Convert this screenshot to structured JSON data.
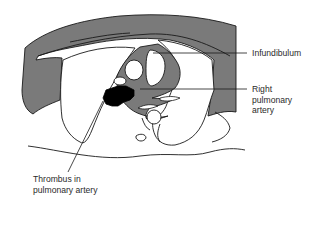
{
  "diagram": {
    "colors": {
      "background": "#ffffff",
      "outline": "#1a1a1a",
      "tissue_gray": "#7a7a7a",
      "thrombus": "#000000",
      "label_text": "#2a2a2a"
    },
    "labels": [
      {
        "id": "infundibulum",
        "text": "Infundibulum",
        "x": 252,
        "y": 48
      },
      {
        "id": "right-pulmonary-artery",
        "text": "Right\npulmonary\nartery",
        "x": 252,
        "y": 84
      },
      {
        "id": "thrombus",
        "text": "Thrombus in\npulmonary artery",
        "x": 33,
        "y": 174
      }
    ],
    "leader_lines": [
      {
        "target": "infundibulum",
        "x1": 153,
        "y1": 53,
        "x2": 247,
        "y2": 53
      },
      {
        "target": "right-pulmonary-artery",
        "x1": 140,
        "y1": 89,
        "x2": 247,
        "y2": 89
      },
      {
        "target": "thrombus",
        "x1": 103,
        "y1": 101,
        "x2": 68,
        "y2": 172
      }
    ]
  }
}
